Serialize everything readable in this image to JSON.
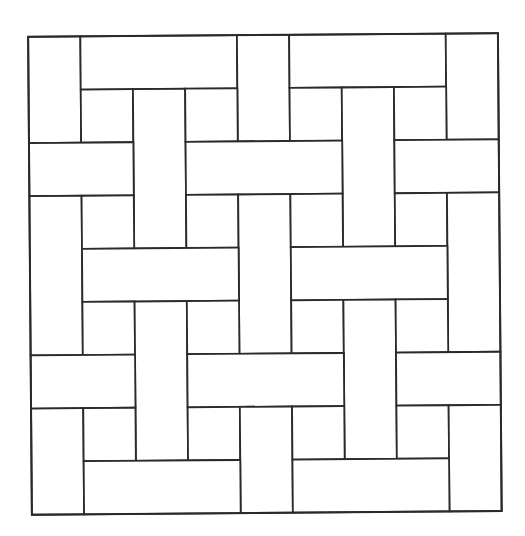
{
  "diagram": {
    "type": "basketweave-tiling",
    "grid": {
      "cols": 9,
      "rows": 9
    },
    "origin": {
      "x": 30,
      "y": 35
    },
    "unit": {
      "w": 52.2,
      "h": 53.1
    },
    "rotation_deg": -0.45,
    "colors": {
      "stroke": "#2a2a2a",
      "fill": "#ffffff",
      "background": "#ffffff"
    },
    "tiles": [
      {
        "kind": "vertical",
        "col": 0,
        "row": 0,
        "w": 1,
        "h": 2
      },
      {
        "kind": "horizontal",
        "col": 1,
        "row": 0,
        "w": 3,
        "h": 1
      },
      {
        "kind": "vertical",
        "col": 4,
        "row": 0,
        "w": 1,
        "h": 2
      },
      {
        "kind": "horizontal",
        "col": 5,
        "row": 0,
        "w": 3,
        "h": 1
      },
      {
        "kind": "vertical",
        "col": 8,
        "row": 0,
        "w": 1,
        "h": 2
      },
      {
        "kind": "square",
        "col": 1,
        "row": 1,
        "w": 1,
        "h": 1
      },
      {
        "kind": "vertical",
        "col": 2,
        "row": 1,
        "w": 1,
        "h": 3
      },
      {
        "kind": "square",
        "col": 3,
        "row": 1,
        "w": 1,
        "h": 1
      },
      {
        "kind": "square",
        "col": 5,
        "row": 1,
        "w": 1,
        "h": 1
      },
      {
        "kind": "vertical",
        "col": 6,
        "row": 1,
        "w": 1,
        "h": 3
      },
      {
        "kind": "square",
        "col": 7,
        "row": 1,
        "w": 1,
        "h": 1
      },
      {
        "kind": "horizontal",
        "col": 0,
        "row": 2,
        "w": 2,
        "h": 1
      },
      {
        "kind": "horizontal",
        "col": 3,
        "row": 2,
        "w": 3,
        "h": 1
      },
      {
        "kind": "horizontal",
        "col": 7,
        "row": 2,
        "w": 2,
        "h": 1
      },
      {
        "kind": "vertical",
        "col": 0,
        "row": 3,
        "w": 1,
        "h": 3
      },
      {
        "kind": "square",
        "col": 1,
        "row": 3,
        "w": 1,
        "h": 1
      },
      {
        "kind": "square",
        "col": 3,
        "row": 3,
        "w": 1,
        "h": 1
      },
      {
        "kind": "vertical",
        "col": 4,
        "row": 3,
        "w": 1,
        "h": 3
      },
      {
        "kind": "square",
        "col": 5,
        "row": 3,
        "w": 1,
        "h": 1
      },
      {
        "kind": "square",
        "col": 7,
        "row": 3,
        "w": 1,
        "h": 1
      },
      {
        "kind": "vertical",
        "col": 8,
        "row": 3,
        "w": 1,
        "h": 3
      },
      {
        "kind": "horizontal",
        "col": 1,
        "row": 4,
        "w": 3,
        "h": 1
      },
      {
        "kind": "horizontal",
        "col": 5,
        "row": 4,
        "w": 3,
        "h": 1
      },
      {
        "kind": "square",
        "col": 1,
        "row": 5,
        "w": 1,
        "h": 1
      },
      {
        "kind": "vertical",
        "col": 2,
        "row": 5,
        "w": 1,
        "h": 3
      },
      {
        "kind": "square",
        "col": 3,
        "row": 5,
        "w": 1,
        "h": 1
      },
      {
        "kind": "square",
        "col": 5,
        "row": 5,
        "w": 1,
        "h": 1
      },
      {
        "kind": "vertical",
        "col": 6,
        "row": 5,
        "w": 1,
        "h": 3
      },
      {
        "kind": "square",
        "col": 7,
        "row": 5,
        "w": 1,
        "h": 1
      },
      {
        "kind": "horizontal",
        "col": 0,
        "row": 6,
        "w": 2,
        "h": 1
      },
      {
        "kind": "horizontal",
        "col": 3,
        "row": 6,
        "w": 3,
        "h": 1
      },
      {
        "kind": "horizontal",
        "col": 7,
        "row": 6,
        "w": 2,
        "h": 1
      },
      {
        "kind": "vertical",
        "col": 0,
        "row": 7,
        "w": 1,
        "h": 2
      },
      {
        "kind": "square",
        "col": 1,
        "row": 7,
        "w": 1,
        "h": 1
      },
      {
        "kind": "square",
        "col": 3,
        "row": 7,
        "w": 1,
        "h": 1
      },
      {
        "kind": "vertical",
        "col": 4,
        "row": 7,
        "w": 1,
        "h": 2
      },
      {
        "kind": "square",
        "col": 5,
        "row": 7,
        "w": 1,
        "h": 1
      },
      {
        "kind": "square",
        "col": 7,
        "row": 7,
        "w": 1,
        "h": 1
      },
      {
        "kind": "vertical",
        "col": 8,
        "row": 7,
        "w": 1,
        "h": 2
      },
      {
        "kind": "horizontal",
        "col": 1,
        "row": 8,
        "w": 3,
        "h": 1
      },
      {
        "kind": "horizontal",
        "col": 5,
        "row": 8,
        "w": 3,
        "h": 1
      }
    ]
  }
}
